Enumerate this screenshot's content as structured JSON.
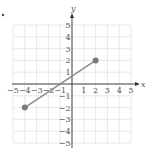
{
  "chart_data": {
    "type": "line",
    "title": "",
    "xlabel": "x",
    "ylabel": "y",
    "xlim": [
      -5,
      5
    ],
    "ylim": [
      -5,
      5
    ],
    "grid": true,
    "x_ticks": [
      -5,
      -4,
      -3,
      -2,
      -1,
      1,
      2,
      3,
      4,
      5
    ],
    "y_ticks": [
      5,
      4,
      3,
      2,
      1,
      -1,
      -2,
      -3,
      -4,
      -5
    ],
    "series": [
      {
        "name": "segment",
        "points": [
          {
            "x": -4,
            "y": -2
          },
          {
            "x": 2,
            "y": 2
          }
        ],
        "endpoints_marked": true
      }
    ]
  },
  "colors": {
    "grid": "#e2e2e2",
    "axis": "#333333",
    "segment": "#8a8a8a",
    "point": "#7a7a7a",
    "label": "#555555"
  },
  "bullet": "•"
}
